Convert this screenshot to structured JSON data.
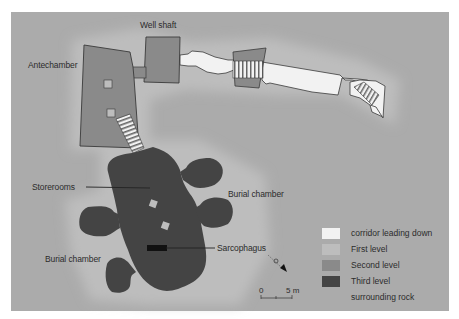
{
  "labels": {
    "antechamber": "Antechamber",
    "well_shaft": "Well shaft",
    "storerooms": "Storerooms",
    "burial_chamber_right": "Burial chamber",
    "burial_chamber_left": "Burial chamber",
    "sarcophagus": "Sarcophagus"
  },
  "legend": {
    "items": [
      {
        "label": "corridor leading down",
        "color": "#f2f2f2"
      },
      {
        "label": "First level",
        "color": "#bdbdbd"
      },
      {
        "label": "Second level",
        "color": "#8a8a8a"
      },
      {
        "label": "Third level",
        "color": "#444444"
      },
      {
        "label": "surrounding rock",
        "color": "#ababab"
      }
    ]
  },
  "scale": {
    "start": "0",
    "end": "5 m"
  },
  "north_arrow": {
    "icon": "compass-arrow-icon",
    "direction": "south-east"
  },
  "colors": {
    "page_border": "#ffffff",
    "rock": "#ababab",
    "halo": "#bdbdbd",
    "corridor": "#f2f2f2",
    "second_level": "#8a8a8a",
    "third_level": "#444444",
    "outline": "#3a3a3a",
    "sarcophagus": "#111111"
  }
}
